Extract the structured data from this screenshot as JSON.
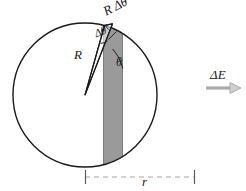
{
  "figure": {
    "colors": {
      "stroke": "#1a1a1a",
      "strip_fill": "#9a9a9a",
      "strip_edge": "#6f6f6f",
      "dimension_line": "#b0b0b0",
      "background": "#ffffff",
      "arrow_fill": "#cfcfcf"
    },
    "labels": {
      "arc_segment": "R Δθ",
      "delta_theta": "Δθ",
      "radius": "R",
      "angle": "θ",
      "field_increment": "ΔE",
      "half_width": "r"
    },
    "geometry": {
      "circle_center_x": 85,
      "circle_center_y": 95,
      "circle_radius": 72,
      "strip_left_x": 103,
      "strip_right_x": 123,
      "wedge_apex_x": 85,
      "wedge_apex_y": 95,
      "dimension_left_x": 85,
      "dimension_right_x": 195,
      "dimension_y": 177
    },
    "annotations": {
      "arrow_direction": "right",
      "dimension_style": "dashed"
    }
  }
}
